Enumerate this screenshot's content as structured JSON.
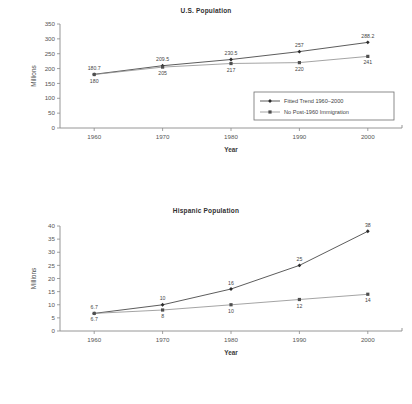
{
  "chart_data": [
    {
      "type": "line",
      "title": "U.S. Population",
      "xlabel": "Year",
      "ylabel": "Millions",
      "x": [
        1960,
        1970,
        1980,
        1990,
        2000
      ],
      "xticks": [
        "1960",
        "1970",
        "1980",
        "1990",
        "2000"
      ],
      "yticks": [
        "0",
        "50",
        "100",
        "150",
        "200",
        "250",
        "300",
        "350"
      ],
      "ylim": [
        0,
        350
      ],
      "xlim": [
        1955,
        2005
      ],
      "grid": false,
      "legend_position": "bottom-right",
      "series": [
        {
          "name": "Fitted Trend 1960–2000",
          "marker": "diamond",
          "values": [
            180.7,
            209.5,
            230.5,
            257,
            288.2
          ],
          "labels": [
            "180.7",
            "209.5",
            "230.5",
            "257",
            "288.2"
          ],
          "label_position": "above"
        },
        {
          "name": "No Post-1960 Immigration",
          "marker": "square",
          "values": [
            180,
            205,
            217,
            220,
            241
          ],
          "labels": [
            "180",
            "205",
            "217",
            "220",
            "241"
          ],
          "label_position": "below"
        }
      ]
    },
    {
      "type": "line",
      "title": "Hispanic Population",
      "xlabel": "Year",
      "ylabel": "Millions",
      "x": [
        1960,
        1970,
        1980,
        1990,
        2000
      ],
      "xticks": [
        "1960",
        "1970",
        "1980",
        "1990",
        "2000"
      ],
      "yticks": [
        "0",
        "5",
        "10",
        "15",
        "20",
        "25",
        "30",
        "35",
        "40"
      ],
      "ylim": [
        0,
        40
      ],
      "xlim": [
        1955,
        2005
      ],
      "grid": false,
      "legend_position": "none",
      "series": [
        {
          "name": "Fitted Trend 1960–2000",
          "marker": "diamond",
          "values": [
            6.7,
            10,
            16,
            25,
            38
          ],
          "labels": [
            "6.7",
            "10",
            "16",
            "25",
            "38"
          ],
          "label_position": "above"
        },
        {
          "name": "No Post-1960 Immigration",
          "marker": "square",
          "values": [
            6.7,
            8,
            10,
            12,
            14
          ],
          "labels": [
            "6.7",
            "8",
            "10",
            "12",
            "14"
          ],
          "label_position": "below"
        }
      ]
    }
  ]
}
